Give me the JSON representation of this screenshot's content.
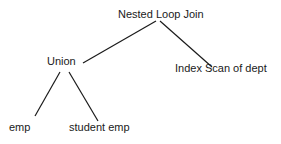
{
  "diagram": {
    "type": "query-plan-tree",
    "nodes": {
      "root": {
        "label": "Nested Loop Join"
      },
      "union": {
        "label": "Union"
      },
      "index_scan": {
        "label": "Index Scan of dept"
      },
      "emp": {
        "label": "emp"
      },
      "student_emp": {
        "label": "student emp"
      }
    },
    "edges": [
      {
        "from": "Nested Loop Join",
        "to": "Union"
      },
      {
        "from": "Nested Loop Join",
        "to": "Index Scan of dept"
      },
      {
        "from": "Union",
        "to": "emp"
      },
      {
        "from": "Union",
        "to": "student emp"
      }
    ],
    "colors": {
      "line": "#1a1a1a",
      "text": "#1a1a1a",
      "background": "#ffffff"
    }
  }
}
